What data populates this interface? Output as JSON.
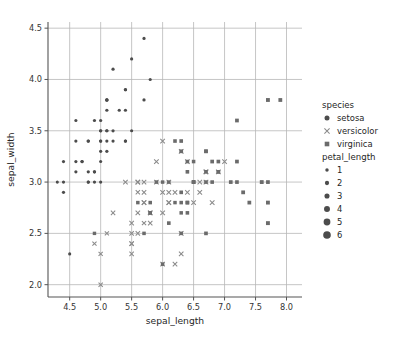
{
  "figure": {
    "width": 400,
    "height": 343,
    "background": "#ffffff",
    "grid": true,
    "grid_color": "#b8b8b8",
    "axis_color": "#555555"
  },
  "chart_data": {
    "type": "scatter",
    "title": "",
    "xlabel": "sepal_length",
    "ylabel": "sepal_width",
    "xlim": [
      4.15,
      8.25
    ],
    "ylim": [
      1.88,
      4.56
    ],
    "xticks": [
      "4.5",
      "5.0",
      "5.5",
      "6.0",
      "6.5",
      "7.0",
      "7.5",
      "8.0"
    ],
    "xtick_values": [
      4.5,
      5.0,
      5.5,
      6.0,
      6.5,
      7.0,
      7.5,
      8.0
    ],
    "yticks": [
      "2.0",
      "2.5",
      "3.0",
      "3.5",
      "4.0",
      "4.5"
    ],
    "ytick_values": [
      2.0,
      2.5,
      3.0,
      3.5,
      4.0,
      4.5
    ],
    "grid": true,
    "legend_position": "right",
    "hue": "species",
    "size": "petal_length",
    "style": "species",
    "series": [
      {
        "name": "setosa",
        "marker": "circle",
        "color": "#4c4c4c",
        "points": [
          [
            5.1,
            3.5,
            1.4
          ],
          [
            4.9,
            3.0,
            1.4
          ],
          [
            4.7,
            3.2,
            1.3
          ],
          [
            4.6,
            3.1,
            1.5
          ],
          [
            5.0,
            3.6,
            1.4
          ],
          [
            5.4,
            3.9,
            1.7
          ],
          [
            4.6,
            3.4,
            1.4
          ],
          [
            5.0,
            3.4,
            1.5
          ],
          [
            4.4,
            2.9,
            1.4
          ],
          [
            4.9,
            3.1,
            1.5
          ],
          [
            5.4,
            3.7,
            1.5
          ],
          [
            4.8,
            3.4,
            1.6
          ],
          [
            4.8,
            3.0,
            1.4
          ],
          [
            4.3,
            3.0,
            1.1
          ],
          [
            5.8,
            4.0,
            1.2
          ],
          [
            5.7,
            4.4,
            1.5
          ],
          [
            5.4,
            3.9,
            1.3
          ],
          [
            5.1,
            3.5,
            1.4
          ],
          [
            5.7,
            3.8,
            1.7
          ],
          [
            5.1,
            3.8,
            1.5
          ],
          [
            5.4,
            3.4,
            1.7
          ],
          [
            5.1,
            3.7,
            1.5
          ],
          [
            4.6,
            3.6,
            1.0
          ],
          [
            5.1,
            3.3,
            1.7
          ],
          [
            4.8,
            3.4,
            1.9
          ],
          [
            5.0,
            3.0,
            1.6
          ],
          [
            5.0,
            3.4,
            1.6
          ],
          [
            5.2,
            3.5,
            1.5
          ],
          [
            5.2,
            3.4,
            1.4
          ],
          [
            4.7,
            3.2,
            1.6
          ],
          [
            4.8,
            3.1,
            1.6
          ],
          [
            5.4,
            3.4,
            1.5
          ],
          [
            5.2,
            4.1,
            1.5
          ],
          [
            5.5,
            4.2,
            1.4
          ],
          [
            4.9,
            3.1,
            1.5
          ],
          [
            5.0,
            3.2,
            1.2
          ],
          [
            5.5,
            3.5,
            1.3
          ],
          [
            4.9,
            3.6,
            1.4
          ],
          [
            4.4,
            3.0,
            1.3
          ],
          [
            5.1,
            3.4,
            1.5
          ],
          [
            5.0,
            3.5,
            1.3
          ],
          [
            4.5,
            2.3,
            1.3
          ],
          [
            4.4,
            3.2,
            1.3
          ],
          [
            5.0,
            3.5,
            1.6
          ],
          [
            5.1,
            3.8,
            1.9
          ],
          [
            4.8,
            3.0,
            1.4
          ],
          [
            5.1,
            3.8,
            1.6
          ],
          [
            4.6,
            3.2,
            1.4
          ],
          [
            5.3,
            3.7,
            1.5
          ],
          [
            5.0,
            3.3,
            1.4
          ]
        ]
      },
      {
        "name": "versicolor",
        "marker": "x",
        "color": "#8a8a8a",
        "points": [
          [
            7.0,
            3.2,
            4.7
          ],
          [
            6.4,
            3.2,
            4.5
          ],
          [
            6.9,
            3.1,
            4.9
          ],
          [
            5.5,
            2.3,
            4.0
          ],
          [
            6.5,
            2.8,
            4.6
          ],
          [
            5.7,
            2.8,
            4.5
          ],
          [
            6.3,
            3.3,
            4.7
          ],
          [
            4.9,
            2.4,
            3.3
          ],
          [
            6.6,
            2.9,
            4.6
          ],
          [
            5.2,
            2.7,
            3.9
          ],
          [
            5.0,
            2.0,
            3.5
          ],
          [
            5.9,
            3.0,
            4.2
          ],
          [
            6.0,
            2.2,
            4.0
          ],
          [
            6.1,
            2.9,
            4.7
          ],
          [
            5.6,
            2.9,
            3.6
          ],
          [
            6.7,
            3.1,
            4.4
          ],
          [
            5.6,
            3.0,
            4.5
          ],
          [
            5.8,
            2.7,
            4.1
          ],
          [
            6.2,
            2.2,
            4.5
          ],
          [
            5.6,
            2.5,
            3.9
          ],
          [
            5.9,
            3.2,
            4.8
          ],
          [
            6.1,
            2.8,
            4.0
          ],
          [
            6.3,
            2.5,
            4.9
          ],
          [
            6.1,
            2.8,
            4.7
          ],
          [
            6.4,
            2.9,
            4.3
          ],
          [
            6.6,
            3.0,
            4.4
          ],
          [
            6.8,
            2.8,
            4.8
          ],
          [
            6.7,
            3.0,
            5.0
          ],
          [
            6.0,
            2.9,
            4.5
          ],
          [
            5.7,
            2.6,
            3.5
          ],
          [
            5.5,
            2.4,
            3.8
          ],
          [
            5.5,
            2.4,
            3.7
          ],
          [
            5.8,
            2.7,
            3.9
          ],
          [
            6.0,
            2.7,
            5.1
          ],
          [
            5.4,
            3.0,
            4.5
          ],
          [
            6.0,
            3.4,
            4.5
          ],
          [
            6.7,
            3.1,
            4.7
          ],
          [
            6.3,
            2.3,
            4.4
          ],
          [
            5.6,
            3.0,
            4.1
          ],
          [
            5.5,
            2.5,
            4.0
          ],
          [
            5.5,
            2.6,
            4.4
          ],
          [
            6.1,
            3.0,
            4.6
          ],
          [
            5.8,
            2.6,
            4.0
          ],
          [
            5.0,
            2.3,
            3.3
          ],
          [
            5.6,
            2.7,
            4.2
          ],
          [
            5.7,
            3.0,
            4.2
          ],
          [
            5.7,
            2.9,
            4.2
          ],
          [
            6.2,
            2.9,
            4.3
          ],
          [
            5.1,
            2.5,
            3.0
          ],
          [
            5.7,
            2.8,
            4.1
          ]
        ]
      },
      {
        "name": "virginica",
        "marker": "square",
        "color": "#6b6b6b",
        "points": [
          [
            6.3,
            3.3,
            6.0
          ],
          [
            5.8,
            2.7,
            5.1
          ],
          [
            7.1,
            3.0,
            5.9
          ],
          [
            6.3,
            2.9,
            5.6
          ],
          [
            6.5,
            3.0,
            5.8
          ],
          [
            7.6,
            3.0,
            6.6
          ],
          [
            4.9,
            2.5,
            4.5
          ],
          [
            7.3,
            2.9,
            6.3
          ],
          [
            6.7,
            2.5,
            5.8
          ],
          [
            7.2,
            3.6,
            6.1
          ],
          [
            6.5,
            3.2,
            5.1
          ],
          [
            6.4,
            2.7,
            5.3
          ],
          [
            6.8,
            3.0,
            5.5
          ],
          [
            5.7,
            2.5,
            5.0
          ],
          [
            5.8,
            2.8,
            5.1
          ],
          [
            6.4,
            3.2,
            5.3
          ],
          [
            6.5,
            3.0,
            5.5
          ],
          [
            7.7,
            3.8,
            6.7
          ],
          [
            7.7,
            2.6,
            6.9
          ],
          [
            6.0,
            2.2,
            5.0
          ],
          [
            6.9,
            3.2,
            5.7
          ],
          [
            5.6,
            2.8,
            4.9
          ],
          [
            7.7,
            2.8,
            6.7
          ],
          [
            6.3,
            2.7,
            4.9
          ],
          [
            6.7,
            3.3,
            5.7
          ],
          [
            7.2,
            3.2,
            6.0
          ],
          [
            6.2,
            2.8,
            4.8
          ],
          [
            6.1,
            3.0,
            4.9
          ],
          [
            6.4,
            2.8,
            5.6
          ],
          [
            7.2,
            3.0,
            5.8
          ],
          [
            7.4,
            2.8,
            6.1
          ],
          [
            7.9,
            3.8,
            6.4
          ],
          [
            6.4,
            2.8,
            5.6
          ],
          [
            6.3,
            2.8,
            5.1
          ],
          [
            6.1,
            2.6,
            5.6
          ],
          [
            7.7,
            3.0,
            6.1
          ],
          [
            6.3,
            3.4,
            5.6
          ],
          [
            6.4,
            3.1,
            5.5
          ],
          [
            6.0,
            3.0,
            4.8
          ],
          [
            6.9,
            3.1,
            5.4
          ],
          [
            6.7,
            3.1,
            5.6
          ],
          [
            6.9,
            3.1,
            5.1
          ],
          [
            5.8,
            2.7,
            5.1
          ],
          [
            6.8,
            3.2,
            5.9
          ],
          [
            6.7,
            3.3,
            5.7
          ],
          [
            6.7,
            3.0,
            5.2
          ],
          [
            6.3,
            2.5,
            5.0
          ],
          [
            6.5,
            3.0,
            5.2
          ],
          [
            6.2,
            3.4,
            5.4
          ],
          [
            5.9,
            3.0,
            5.1
          ]
        ]
      }
    ]
  },
  "legend": {
    "species": {
      "title": "species",
      "entries": [
        {
          "label": "setosa",
          "marker": "circle"
        },
        {
          "label": "versicolor",
          "marker": "x"
        },
        {
          "label": "virginica",
          "marker": "square"
        }
      ]
    },
    "petal_length": {
      "title": "petal_length",
      "entries": [
        {
          "label": "1",
          "size": 1
        },
        {
          "label": "2",
          "size": 2
        },
        {
          "label": "3",
          "size": 3
        },
        {
          "label": "4",
          "size": 4
        },
        {
          "label": "5",
          "size": 5
        },
        {
          "label": "6",
          "size": 6
        }
      ]
    }
  }
}
